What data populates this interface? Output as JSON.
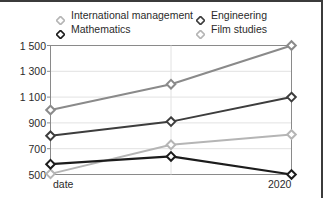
{
  "chart_data": {
    "type": "line",
    "title": "",
    "xlabel": "",
    "ylabel": "",
    "x": [
      "date",
      "",
      "2020"
    ],
    "x_tick_labels": [
      "date",
      "2020"
    ],
    "categories": [
      "date",
      "",
      "2020"
    ],
    "ylim": [
      500,
      1500
    ],
    "y_ticks": [
      500,
      700,
      900,
      1100,
      1300,
      1500
    ],
    "y_tick_labels": [
      "500",
      "700",
      "900",
      "1 100",
      "1 300",
      "1 500"
    ],
    "grid": true,
    "legend_position": "top",
    "series": [
      {
        "name": "International management",
        "values": [
          505,
          730,
          810
        ],
        "color": "#b5b5b5",
        "marker": "diamond-open"
      },
      {
        "name": "Mathematics",
        "values": [
          580,
          640,
          500
        ],
        "color": "#1c1c1c",
        "marker": "diamond-open"
      },
      {
        "name": "Engineering",
        "values": [
          800,
          910,
          1100
        ],
        "color": "#3d3d3d",
        "marker": "diamond-open"
      },
      {
        "name": "Film studies",
        "values": [
          1000,
          1200,
          1500
        ],
        "color": "#8a8a8a",
        "marker": "diamond-open"
      }
    ]
  },
  "legend": {
    "entries": [
      {
        "label": "International management",
        "color": "#b5b5b5",
        "row": 0,
        "col": 0
      },
      {
        "label": "Engineering",
        "color": "#3d3d3d",
        "row": 0,
        "col": 1
      },
      {
        "label": "Mathematics",
        "color": "#1c1c1c",
        "row": 1,
        "col": 0
      },
      {
        "label": "Film studies",
        "color": "#b5b5b5",
        "row": 1,
        "col": 1
      }
    ]
  },
  "axis": {
    "y_labels": [
      "1 500",
      "1 300",
      "1 100",
      "900",
      "700",
      "500"
    ],
    "x_label_left": "date",
    "x_label_right": "2020"
  },
  "colors": {
    "frame": "#8a8a8a",
    "grid": "#e2e2e2",
    "border": "#3b3b3b",
    "text": "#2b2b2b",
    "background": "#ffffff"
  }
}
